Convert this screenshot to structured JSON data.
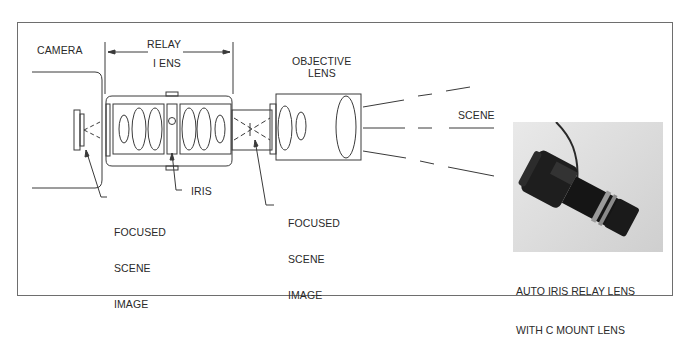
{
  "figure": {
    "labels": {
      "camera": "CAMERA",
      "relay_line1": "RELAY",
      "relay_line2": "I ENS",
      "objective_line1": "OBJECTIVE",
      "objective_line2": "LENS",
      "scene": "SCENE",
      "iris": "IRIS",
      "focused_image_1": [
        "FOCUSED",
        "SCENE",
        "IMAGE"
      ],
      "focused_image_2": [
        "FOCUSED",
        "SCENE",
        "IMAGE"
      ]
    },
    "photo": {
      "subject": "auto iris relay lens with C mount lens",
      "caption_line1": "AUTO IRIS RELAY LENS",
      "caption_line2": "WITH C MOUNT LENS"
    },
    "colors": {
      "line": "#3a3a3a",
      "frame": "#6e6e6e",
      "text": "#2a2a2a",
      "photo_bg": "#dcdcdc",
      "lens_body": "#1a1a1a"
    }
  }
}
